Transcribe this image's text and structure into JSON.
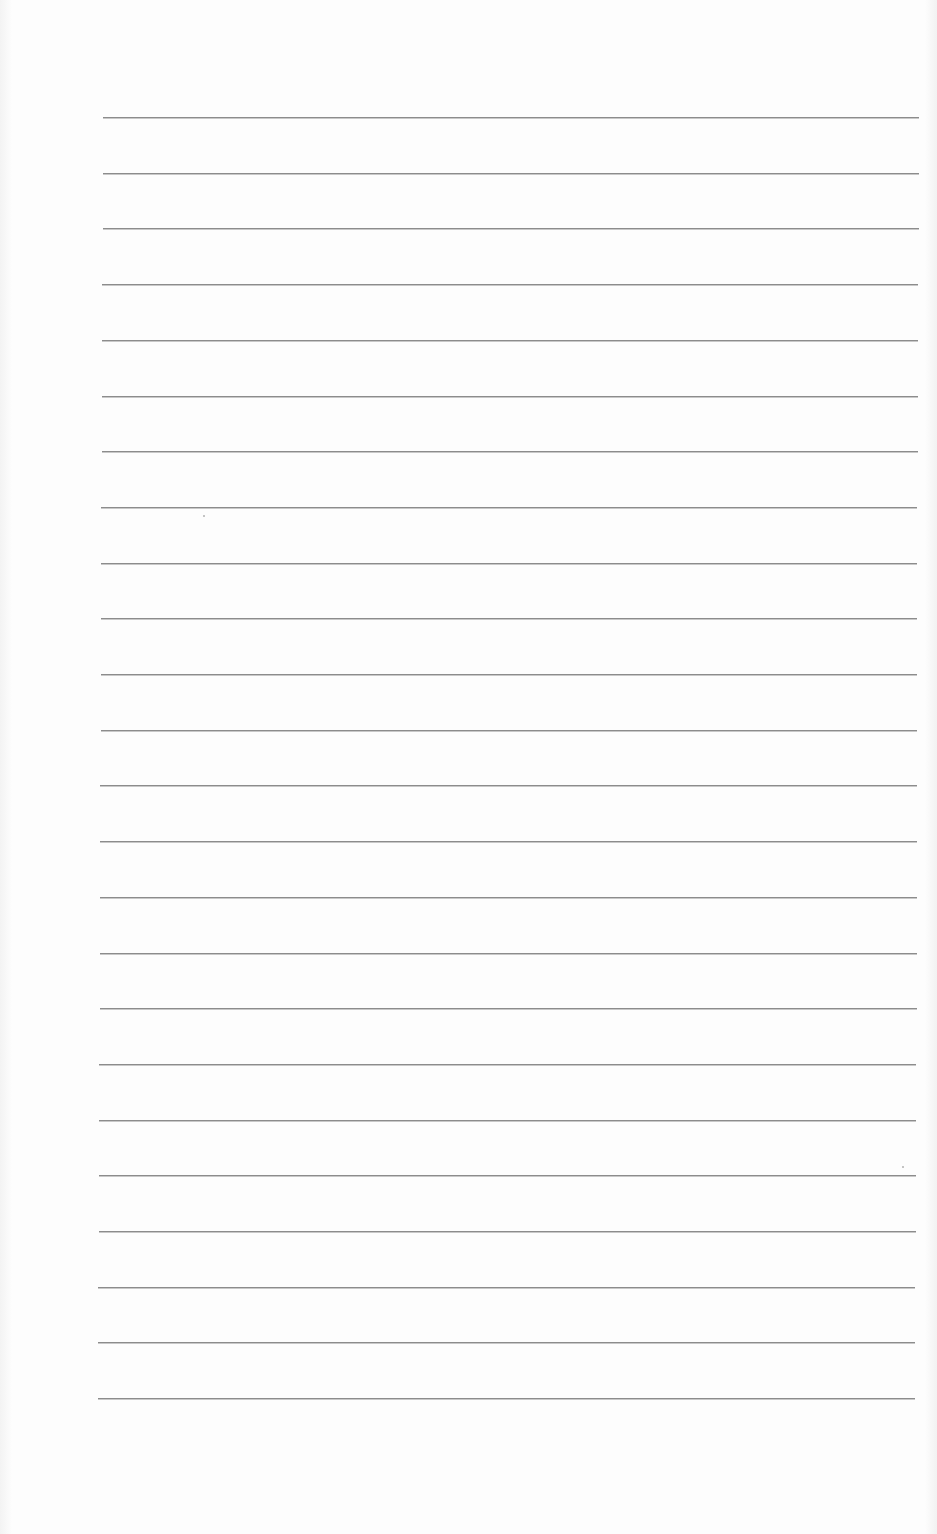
{
  "document": {
    "type": "blank lined page",
    "line_count": 24,
    "line_color": "#8c8c8c",
    "background_color": "#fdfdfd",
    "first_line_y": 117,
    "line_spacing": 55.7,
    "line_left_top": 103,
    "line_left_bottom": 98,
    "line_right": 919
  }
}
